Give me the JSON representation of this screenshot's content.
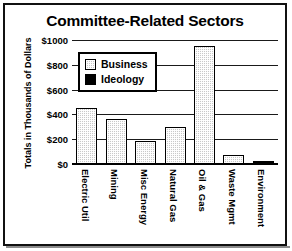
{
  "figure": {
    "border_color": "#111111",
    "background": "#ffffff"
  },
  "chart_data": {
    "type": "bar",
    "title": "Committee-Related Sectors",
    "xlabel": "",
    "ylabel": "Totals in Thousands of Dollars",
    "categories": [
      "Electric Util",
      "Mining",
      "Misc Energy",
      "Natural Gas",
      "Oil & Gas",
      "Waste Mgmt",
      "Environment"
    ],
    "series": [
      {
        "name": "Business",
        "color": "#c9c9c9",
        "pattern": "dotted-gray",
        "values": [
          455,
          360,
          185,
          300,
          955,
          75,
          0
        ]
      },
      {
        "name": "Ideology",
        "color": "#000000",
        "pattern": "solid-black",
        "values": [
          0,
          0,
          0,
          0,
          0,
          0,
          15
        ]
      }
    ],
    "bars": [
      {
        "category": "Electric Util",
        "value": 455,
        "series": "Business"
      },
      {
        "category": "Mining",
        "value": 360,
        "series": "Business"
      },
      {
        "category": "Misc Energy",
        "value": 185,
        "series": "Business"
      },
      {
        "category": "Natural Gas",
        "value": 300,
        "series": "Business"
      },
      {
        "category": "Oil & Gas",
        "value": 955,
        "series": "Business"
      },
      {
        "category": "Waste Mgmt",
        "value": 75,
        "series": "Business"
      },
      {
        "category": "Environment",
        "value": 15,
        "series": "Ideology"
      }
    ],
    "ylim": [
      0,
      1000
    ],
    "ytick_values": [
      0,
      200,
      400,
      600,
      800,
      1000
    ],
    "ytick_labels": [
      "$0",
      "$200",
      "$400",
      "$600",
      "$800",
      "$1000"
    ],
    "grid": true,
    "grid_axis": "y",
    "legend_position": "upper-left-inside",
    "legend_entries": [
      "Business",
      "Ideology"
    ]
  }
}
